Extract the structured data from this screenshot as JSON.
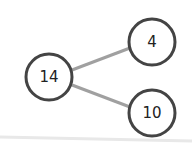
{
  "diagram": {
    "type": "number-bond",
    "whole": {
      "value": "14",
      "cx": 49,
      "cy": 77
    },
    "parts": [
      {
        "value": "4",
        "cx": 152,
        "cy": 42
      },
      {
        "value": "10",
        "cx": 152,
        "cy": 113
      }
    ],
    "colors": {
      "circle_stroke": "#444444",
      "connector": "#a0a0a0",
      "text": "#222222",
      "baseline": "#e6e6e6"
    }
  }
}
